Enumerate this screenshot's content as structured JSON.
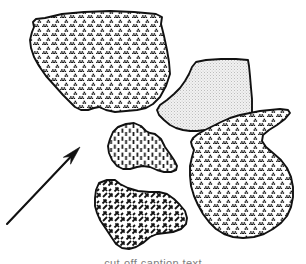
{
  "figure": {
    "background_color": "#ffffff",
    "outline_color": "#111111",
    "width": 306,
    "height": 264,
    "caption_fragment": "cut-off caption text"
  },
  "patterns": {
    "trefoil": {
      "name": "trefoil-stipple",
      "description": "dense grid of small dark trefoil / triple-dot clusters",
      "ink_color": "#111111",
      "fill_color": "#ffffff",
      "tile_size": 9
    },
    "light_stipple": {
      "name": "light-stipple",
      "description": "very fine pale gray dot stipple",
      "ink_color": "#b9b9b9",
      "fill_color": "#f0f0f0",
      "tile_size": 3
    },
    "vertical_dash": {
      "name": "vertical-dash",
      "description": "columns of short vertical dashes",
      "ink_color": "#111111",
      "fill_color": "#ffffff",
      "tile_size": 8
    },
    "diagonal_dash": {
      "name": "diagonal-dash-crosshatch",
      "description": "short diagonal dashes in two opposing directions",
      "ink_color": "#111111",
      "fill_color": "#ffffff",
      "tile_size": 10
    }
  },
  "regions": [
    {
      "id": "region-upper-left",
      "label": "Upper left region",
      "pattern": "trefoil-stipple",
      "position": "upper-left",
      "points": "45,18 62,14 84,12 110,11 134,12 156,14 162,17 161,24 164,36 167,50 169,62 170,74 166,86 160,97 153,104 146,108 137,110 126,111 115,112 106,110 99,107 94,108 88,110 81,110 75,107 70,102 63,95 55,86 46,76 39,66 34,57 31,48 30,40 32,32 34,27 33,22 36,19"
    },
    {
      "id": "region-upper-right",
      "label": "Upper right region",
      "pattern": "light-stipple",
      "position": "upper-right",
      "points": "196,62 206,60 221,59 236,59 248,60 249,66 250,76 251,88 252,99 252,110 252,120 250,128 245,131 236,132 224,131 214,130 205,130 197,131 190,131 183,130 176,128 170,125 164,120 159,115 157,110 160,105 167,100 174,94 180,88 185,81 189,74 192,67"
    },
    {
      "id": "region-center-small",
      "label": "Center small region",
      "pattern": "vertical-dash",
      "position": "center",
      "points": "118,127 126,124 134,123 141,126 146,131 150,133 155,134 161,139 165,147 170,154 174,160 177,166 176,170 171,172 164,172 157,170 150,167 143,166 137,167 130,169 123,169 117,166 112,160 109,153 108,146 110,139 113,132"
    },
    {
      "id": "region-lower-middle",
      "label": "Lower middle region",
      "pattern": "diagonal-dash-crosshatch",
      "position": "lower-middle",
      "points": "99,183 107,180 115,180 120,184 128,188 138,191 149,192 159,192 167,194 174,199 180,205 185,211 187,218 186,224 181,229 173,232 165,233 157,234 150,237 143,243 136,247 129,249 122,248 116,244 112,238 108,232 104,226 100,220 97,213 95,206 95,198 96,190"
    },
    {
      "id": "region-right",
      "label": "Right region",
      "pattern": "trefoil-stipple",
      "position": "right",
      "points": "288,110 290,113 285,119 277,125 269,130 263,135 262,141 266,147 273,153 281,160 287,168 291,177 293,187 293,197 291,207 287,216 281,223 273,229 264,234 254,237 243,238 233,237 224,234 216,229 209,222 203,214 198,205 194,196 191,186 190,176 190,166 192,157 194,150 192,146 191,142 193,138 198,134 205,130 213,126 221,122 230,118 240,115 250,113 260,111 270,110 280,109"
    }
  ],
  "arrow": {
    "id": "annotation-arrow",
    "label": "Direction of movement arrow",
    "direction": "up-right",
    "tail_x": 7,
    "tail_y": 224,
    "tip_x": 80,
    "tip_y": 147,
    "color": "#111111"
  }
}
